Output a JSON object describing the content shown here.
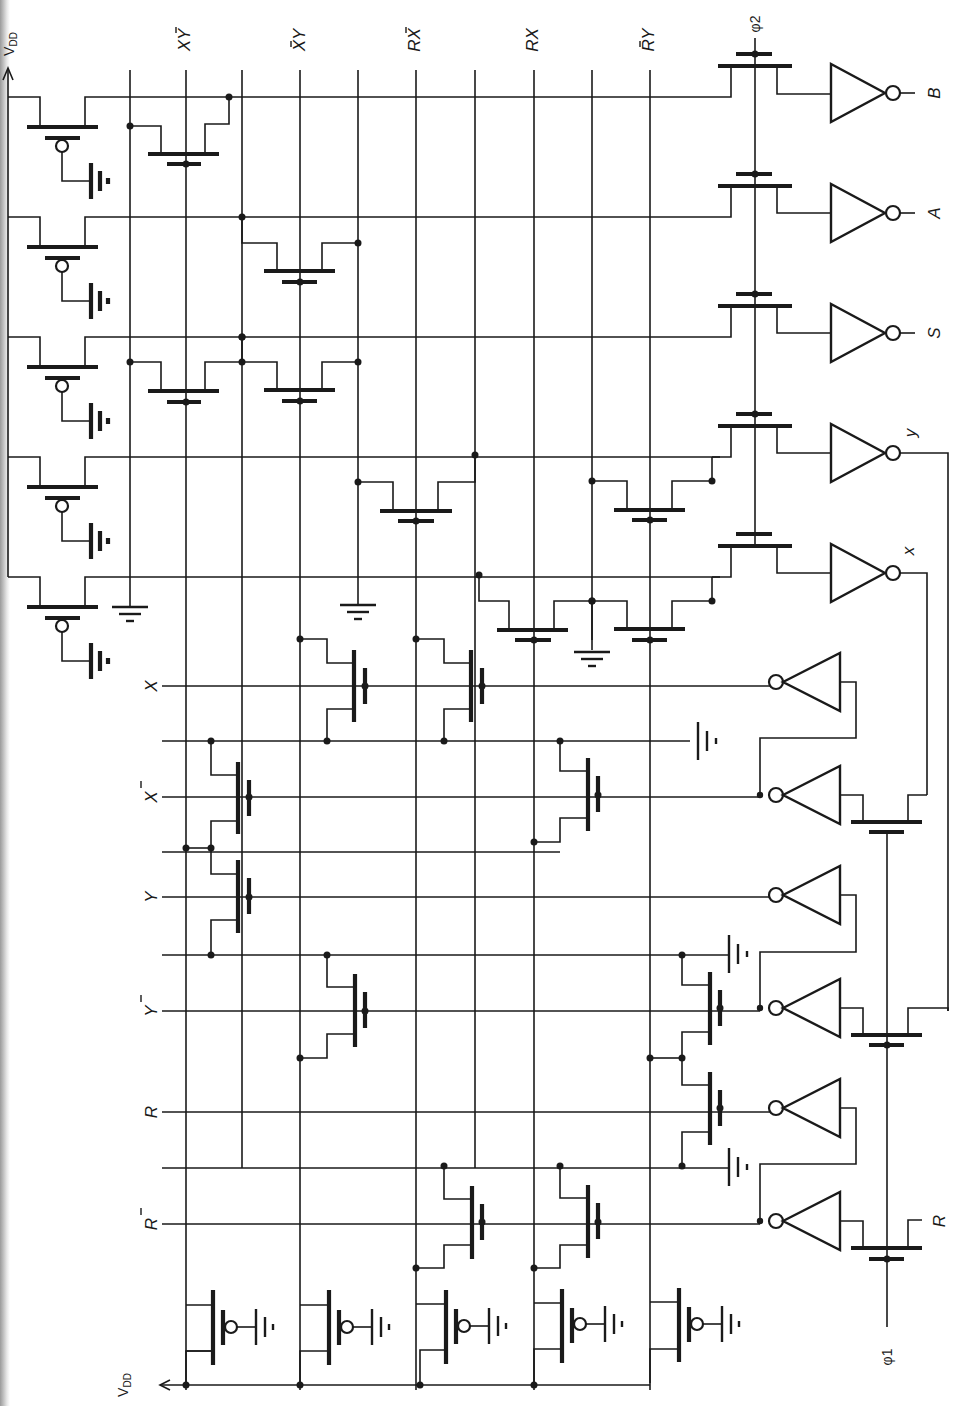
{
  "figure": {
    "type": "CMOS PLA-style sequential logic schematic (rotated 90°)",
    "supply_label": "V_DD",
    "supply_label_main": "V",
    "supply_label_sub": "DD",
    "clock_labels": {
      "phi1": "φ1",
      "phi2": "φ2"
    }
  },
  "column_terms": [
    {
      "id": "col-xybar",
      "label": "XȲ",
      "main": "XY",
      "bar_over": "Y"
    },
    {
      "id": "col-xbary",
      "label": "X̄Y",
      "main": "XY",
      "bar_over": "X"
    },
    {
      "id": "col-rxbar",
      "label": "RX̄",
      "main": "RX",
      "bar_over": "X"
    },
    {
      "id": "col-rx",
      "label": "RX",
      "main": "RX",
      "bar_over": ""
    },
    {
      "id": "col-rbary",
      "label": "R̄Y",
      "main": "RY",
      "bar_over": "R"
    }
  ],
  "row_inputs": [
    {
      "id": "in-x",
      "label": "X",
      "bar": false
    },
    {
      "id": "in-xbar",
      "label": "X̄",
      "bar": true,
      "text": "X"
    },
    {
      "id": "in-y",
      "label": "Y",
      "bar": false
    },
    {
      "id": "in-ybar",
      "label": "Ȳ",
      "bar": true,
      "text": "Y"
    },
    {
      "id": "in-r",
      "label": "R",
      "bar": false
    },
    {
      "id": "in-rbar",
      "label": "R̄",
      "bar": true,
      "text": "R"
    }
  ],
  "outputs": [
    {
      "id": "out-b",
      "label": "B"
    },
    {
      "id": "out-a",
      "label": "A"
    },
    {
      "id": "out-s",
      "label": "S"
    },
    {
      "id": "out-y",
      "label": "y"
    },
    {
      "id": "out-x",
      "label": "x"
    }
  ],
  "external_input": {
    "label": "R"
  },
  "components": {
    "pmos_loads_top": 5,
    "pmos_loads_bottom": 5,
    "pass_transistors_phi2": 5,
    "pass_transistors_phi1": 3,
    "output_inverters": 5,
    "input_inverters": 6,
    "ground_symbols": 4,
    "battery_bias_symbols": 3
  }
}
